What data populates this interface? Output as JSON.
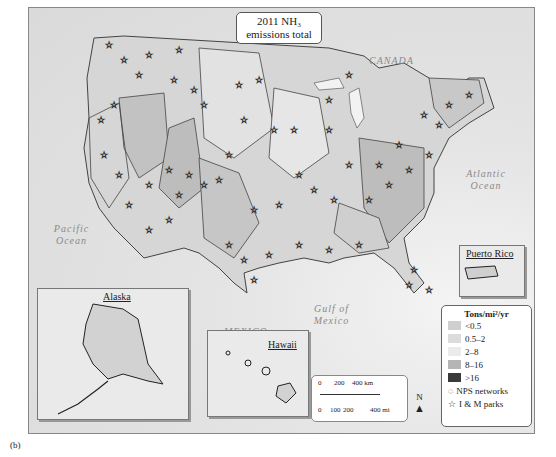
{
  "title": {
    "line1": "2011 NH₃",
    "line2": "emissions total"
  },
  "labels": {
    "canada": "CANADA",
    "atlantic": "Atlantic Ocean",
    "pacific": "Pacific Ocean",
    "gulf": "Gulf of Mexico",
    "mexico": "MEXICO"
  },
  "insets": {
    "alaska": "Alaska",
    "hawaii": "Hawaii",
    "puerto_rico": "Puerto Rico"
  },
  "legend": {
    "header": "Tons/mi²/yr",
    "classes": [
      {
        "label": "<0.5",
        "color": "#cfcfcf"
      },
      {
        "label": "0.5–2",
        "color": "#dcdcdc"
      },
      {
        "label": "2–8",
        "color": "#ebebeb"
      },
      {
        "label": "8–16",
        "color": "#b5b5b5"
      },
      {
        "label": ">16",
        "color": "#3a3a3a"
      }
    ],
    "nps": "NPS networks",
    "parks": "I & M parks"
  },
  "scale": {
    "km_ticks": [
      "0",
      "200",
      "400 km"
    ],
    "mi_ticks": [
      "0",
      "100",
      "200",
      "400 mi"
    ]
  },
  "north": "N",
  "caption": "(b)"
}
